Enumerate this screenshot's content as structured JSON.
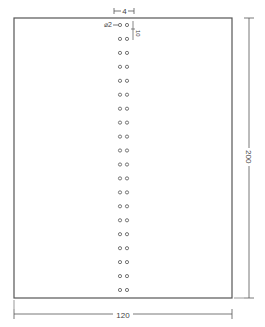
{
  "drawing": {
    "type": "technical-drawing",
    "plate": {
      "width_label": "120",
      "height_label": "200"
    },
    "hole_spacing_label": "4",
    "hole_diameter_label": "⌀2",
    "edge_offset_label": "10",
    "hole_rows": 20,
    "holes_per_row": 2,
    "footer_note": "",
    "colors": {
      "line": "#555555",
      "hole": "#666666",
      "background": "#ffffff"
    }
  }
}
